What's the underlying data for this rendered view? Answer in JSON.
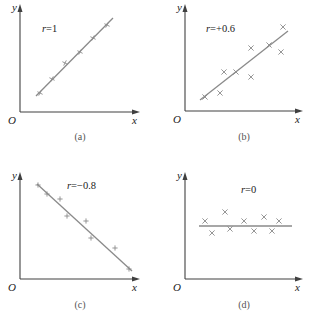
{
  "panels": [
    {
      "id": "a",
      "caption": "(a)",
      "r_label": "r=1",
      "axis_labels": {
        "origin": "O",
        "x": "x",
        "y": "y"
      },
      "origin": [
        20,
        112
      ],
      "x_end": 140,
      "y_end": 4,
      "fit_line": [
        [
          36,
          96
        ],
        [
          113,
          18
        ]
      ],
      "marker": "cross",
      "points": [
        [
          40,
          93
        ],
        [
          52,
          79
        ],
        [
          65,
          63
        ],
        [
          80,
          52
        ],
        [
          93,
          38
        ],
        [
          107,
          25
        ]
      ],
      "label_pos": [
        42,
        32
      ],
      "caption_pos": [
        80,
        140
      ]
    },
    {
      "id": "b",
      "caption": "(b)",
      "r_label": "r=+0.6",
      "axis_labels": {
        "origin": "O",
        "x": "x",
        "y": "y"
      },
      "origin": [
        185,
        111
      ],
      "x_end": 303,
      "y_end": 4,
      "fit_line": [
        [
          200,
          100
        ],
        [
          288,
          31
        ]
      ],
      "marker": "x",
      "points": [
        [
          205,
          97
        ],
        [
          220,
          93
        ],
        [
          224,
          72
        ],
        [
          236,
          72
        ],
        [
          251,
          48
        ],
        [
          251,
          77
        ],
        [
          269,
          45
        ],
        [
          281,
          52
        ],
        [
          283,
          27
        ]
      ],
      "label_pos": [
        206,
        32
      ],
      "caption_pos": [
        244,
        140
      ]
    },
    {
      "id": "c",
      "caption": "(c)",
      "r_label": "r=−0.8",
      "axis_labels": {
        "origin": "O",
        "x": "x",
        "y": "y"
      },
      "origin": [
        20,
        279
      ],
      "x_end": 140,
      "y_end": 172,
      "fit_line": [
        [
          37,
          184
        ],
        [
          132,
          271
        ]
      ],
      "marker": "plus",
      "points": [
        [
          38,
          185
        ],
        [
          47,
          194
        ],
        [
          60,
          199
        ],
        [
          67,
          216
        ],
        [
          86,
          221
        ],
        [
          91,
          238
        ],
        [
          115,
          248
        ],
        [
          129,
          269
        ]
      ],
      "label_pos": [
        67,
        189
      ],
      "caption_pos": [
        80,
        308
      ]
    },
    {
      "id": "d",
      "caption": "(d)",
      "r_label": "r=0",
      "axis_labels": {
        "origin": "O",
        "x": "x",
        "y": "y"
      },
      "origin": [
        185,
        279
      ],
      "x_end": 303,
      "y_end": 172,
      "fit_line": [
        [
          199,
          226
        ],
        [
          292,
          226
        ]
      ],
      "marker": "x",
      "points": [
        [
          205,
          221
        ],
        [
          212,
          233
        ],
        [
          225,
          212
        ],
        [
          230,
          229
        ],
        [
          244,
          221
        ],
        [
          254,
          231
        ],
        [
          264,
          217
        ],
        [
          272,
          231
        ],
        [
          279,
          221
        ]
      ],
      "label_pos": [
        241,
        193
      ],
      "caption_pos": [
        244,
        308
      ]
    }
  ],
  "colors": {
    "axis": "#404040",
    "fit": "#8a8a8a",
    "marker": "#8a8a8a",
    "text": "#222222"
  }
}
